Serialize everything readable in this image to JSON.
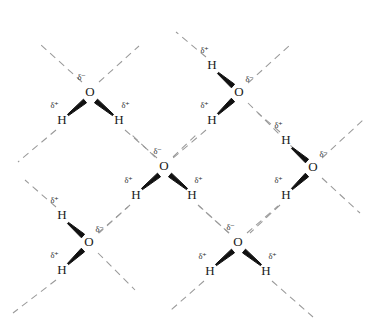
{
  "figure": {
    "background_color": "#ffffff",
    "atom_text_color": "#1a1a1a",
    "charge_text_color": "#2b2b2b",
    "covalent_bond_color": "#111111",
    "hydrogen_bond_color": "#9a9a9a",
    "width": 372,
    "height": 332
  },
  "labels": {
    "oxygen": "O",
    "hydrogen": "H",
    "delta_negative": "δ⁻",
    "delta_positive": "δ⁺"
  },
  "molecules": [
    {
      "id": "molecule-top-left",
      "oxygen": {
        "symbol": "O",
        "x": 90,
        "y": 93,
        "charge": "δ⁻",
        "charge_x": 82,
        "charge_y": 78
      },
      "hydrogens": [
        {
          "symbol": "H",
          "x": 62,
          "y": 121,
          "charge": "δ⁺",
          "charge_x": 55,
          "charge_y": 106
        },
        {
          "symbol": "H",
          "x": 119,
          "y": 121,
          "charge": "δ⁺",
          "charge_x": 126,
          "charge_y": 106
        }
      ]
    },
    {
      "id": "molecule-top-right",
      "oxygen": {
        "symbol": "O",
        "x": 239,
        "y": 93,
        "charge": "δ⁻",
        "charge_x": 250,
        "charge_y": 80
      },
      "hydrogens": [
        {
          "symbol": "H",
          "x": 212,
          "y": 66,
          "charge": "δ⁺",
          "charge_x": 205,
          "charge_y": 51
        },
        {
          "symbol": "H",
          "x": 212,
          "y": 121,
          "charge": "δ⁺",
          "charge_x": 205,
          "charge_y": 106
        }
      ]
    },
    {
      "id": "molecule-center",
      "oxygen": {
        "symbol": "O",
        "x": 164,
        "y": 167,
        "charge": "δ⁻",
        "charge_x": 158,
        "charge_y": 152
      },
      "hydrogens": [
        {
          "symbol": "H",
          "x": 136,
          "y": 196,
          "charge": "δ⁺",
          "charge_x": 129,
          "charge_y": 181
        },
        {
          "symbol": "H",
          "x": 192,
          "y": 196,
          "charge": "δ⁺",
          "charge_x": 199,
          "charge_y": 181
        }
      ]
    },
    {
      "id": "molecule-right",
      "oxygen": {
        "symbol": "O",
        "x": 313,
        "y": 168,
        "charge": "δ⁻",
        "charge_x": 324,
        "charge_y": 155
      },
      "hydrogens": [
        {
          "symbol": "H",
          "x": 286,
          "y": 141,
          "charge": "δ⁺",
          "charge_x": 279,
          "charge_y": 126
        },
        {
          "symbol": "H",
          "x": 286,
          "y": 196,
          "charge": "δ⁺",
          "charge_x": 279,
          "charge_y": 181
        }
      ]
    },
    {
      "id": "molecule-bottom-left",
      "oxygen": {
        "symbol": "O",
        "x": 89,
        "y": 243,
        "charge": "δ⁻",
        "charge_x": 100,
        "charge_y": 230
      },
      "hydrogens": [
        {
          "symbol": "H",
          "x": 62,
          "y": 216,
          "charge": "δ⁺",
          "charge_x": 55,
          "charge_y": 201
        },
        {
          "symbol": "H",
          "x": 62,
          "y": 271,
          "charge": "δ⁺",
          "charge_x": 55,
          "charge_y": 256
        }
      ]
    },
    {
      "id": "molecule-bottom-right",
      "oxygen": {
        "symbol": "O",
        "x": 238,
        "y": 243,
        "charge": "δ⁻",
        "charge_x": 231,
        "charge_y": 228
      },
      "hydrogens": [
        {
          "symbol": "H",
          "x": 210,
          "y": 272,
          "charge": "δ⁺",
          "charge_x": 203,
          "charge_y": 257
        },
        {
          "symbol": "H",
          "x": 266,
          "y": 272,
          "charge": "δ⁺",
          "charge_x": 273,
          "charge_y": 257
        }
      ]
    }
  ],
  "covalent_bonds": [
    {
      "id": "bond-tl-h1",
      "x1": 85,
      "y1": 101,
      "x2": 68,
      "y2": 115
    },
    {
      "id": "bond-tl-h2",
      "x1": 96,
      "y1": 101,
      "x2": 113,
      "y2": 115
    },
    {
      "id": "bond-tr-h1",
      "x1": 233,
      "y1": 86,
      "x2": 218,
      "y2": 73
    },
    {
      "id": "bond-tr-h2",
      "x1": 233,
      "y1": 100,
      "x2": 218,
      "y2": 114
    },
    {
      "id": "bond-c-h1",
      "x1": 159,
      "y1": 175,
      "x2": 142,
      "y2": 189
    },
    {
      "id": "bond-c-h2",
      "x1": 170,
      "y1": 175,
      "x2": 187,
      "y2": 189
    },
    {
      "id": "bond-r-h1",
      "x1": 307,
      "y1": 161,
      "x2": 292,
      "y2": 148
    },
    {
      "id": "bond-r-h2",
      "x1": 307,
      "y1": 175,
      "x2": 292,
      "y2": 189
    },
    {
      "id": "bond-bl-h1",
      "x1": 83,
      "y1": 236,
      "x2": 68,
      "y2": 223
    },
    {
      "id": "bond-bl-h2",
      "x1": 83,
      "y1": 250,
      "x2": 68,
      "y2": 264
    },
    {
      "id": "bond-br-h1",
      "x1": 233,
      "y1": 251,
      "x2": 216,
      "y2": 265
    },
    {
      "id": "bond-br-h2",
      "x1": 244,
      "y1": 251,
      "x2": 261,
      "y2": 265
    }
  ],
  "hydrogen_bonds": [
    {
      "id": "hbond-tl-upleft",
      "x1": 82,
      "y1": 82,
      "x2": 41,
      "y2": 45
    },
    {
      "id": "hbond-tl-upright",
      "x1": 99,
      "y1": 82,
      "x2": 139,
      "y2": 46
    },
    {
      "id": "hbond-tl-h1-down",
      "x1": 56,
      "y1": 130,
      "x2": 18,
      "y2": 162
    },
    {
      "id": "hbond-tl-h2-down",
      "x1": 125,
      "y1": 130,
      "x2": 157,
      "y2": 158
    },
    {
      "id": "hbond-tr-h1-up",
      "x1": 206,
      "y1": 57,
      "x2": 176,
      "y2": 32
    },
    {
      "id": "hbond-tr-upright",
      "x1": 248,
      "y1": 83,
      "x2": 290,
      "y2": 45
    },
    {
      "id": "hbond-tr-downright",
      "x1": 248,
      "y1": 103,
      "x2": 303,
      "y2": 158
    },
    {
      "id": "hbond-tr-h2-down",
      "x1": 206,
      "y1": 130,
      "x2": 173,
      "y2": 158
    },
    {
      "id": "hbond-c-upleft",
      "x1": 155,
      "y1": 157,
      "x2": 131,
      "y2": 134
    },
    {
      "id": "hbond-c-upright",
      "x1": 173,
      "y1": 157,
      "x2": 198,
      "y2": 133
    },
    {
      "id": "hbond-c-h1-downleft",
      "x1": 130,
      "y1": 205,
      "x2": 99,
      "y2": 233
    },
    {
      "id": "hbond-c-h2-downright",
      "x1": 198,
      "y1": 205,
      "x2": 229,
      "y2": 233
    },
    {
      "id": "hbond-r-h1-upleft",
      "x1": 280,
      "y1": 132,
      "x2": 258,
      "y2": 113
    },
    {
      "id": "hbond-r-upright",
      "x1": 322,
      "y1": 158,
      "x2": 363,
      "y2": 120
    },
    {
      "id": "hbond-r-downright",
      "x1": 322,
      "y1": 178,
      "x2": 360,
      "y2": 213
    },
    {
      "id": "hbond-r-h2-downleft",
      "x1": 280,
      "y1": 205,
      "x2": 250,
      "y2": 233
    },
    {
      "id": "hbond-bl-h1-upleft",
      "x1": 56,
      "y1": 207,
      "x2": 25,
      "y2": 180
    },
    {
      "id": "hbond-bl-upright",
      "x1": 98,
      "y1": 233,
      "x2": 128,
      "y2": 207
    },
    {
      "id": "hbond-bl-downright",
      "x1": 98,
      "y1": 253,
      "x2": 135,
      "y2": 290
    },
    {
      "id": "hbond-bl-h2-downleft",
      "x1": 56,
      "y1": 280,
      "x2": 13,
      "y2": 313
    },
    {
      "id": "hbond-br-upleft",
      "x1": 229,
      "y1": 233,
      "x2": 199,
      "y2": 206
    },
    {
      "id": "hbond-br-upright",
      "x1": 247,
      "y1": 233,
      "x2": 278,
      "y2": 206
    },
    {
      "id": "hbond-br-h1-downleft",
      "x1": 204,
      "y1": 281,
      "x2": 171,
      "y2": 310
    },
    {
      "id": "hbond-br-h2-downright",
      "x1": 272,
      "y1": 281,
      "x2": 313,
      "y2": 317
    }
  ]
}
